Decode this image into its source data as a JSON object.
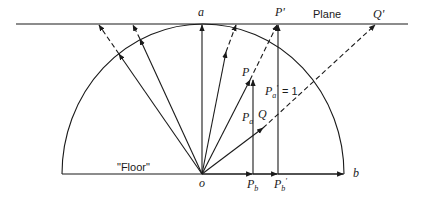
{
  "diagram": {
    "title": "",
    "labels": {
      "a": "a",
      "o": "o",
      "b": "b",
      "plane": "Plane",
      "floor": "\"Floor\"",
      "P": "P",
      "P_prime": "P'",
      "Q": "Q",
      "Q_prime": "Q'",
      "Pa": "P",
      "Pa_sub": "a",
      "Pa_prime": "P",
      "Pa_prime_sub": "a",
      "Pa_prime_mark": "'",
      "Pa_prime_eq": "= 1",
      "Pb": "P",
      "Pb_sub": "b",
      "Pb_prime": "P",
      "Pb_prime_sub": "b",
      "Pb_prime_mark": "'"
    },
    "colors": {
      "ink": "#1a1a1a",
      "background": "#ffffff"
    }
  }
}
